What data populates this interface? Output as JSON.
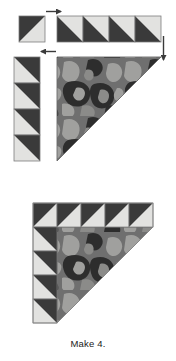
{
  "page": {
    "background_color": "#ffffff",
    "width": 176,
    "height": 361
  },
  "caption": {
    "text": "Make 4.",
    "color": "#1a1a1a"
  },
  "palette": {
    "dark": "#3a3a3a",
    "dark_edge": "#2b2b2b",
    "light": "#e2e2e0",
    "light_edge": "#cfcfcd",
    "print_base": "#6f6f6f",
    "print_shadow": "#2d2d2d",
    "print_highlight": "#a0a09e",
    "outline": "#7a7a7a",
    "arrow": "#3a3a3a",
    "text": "#1a1a1a"
  },
  "steps": [
    {
      "id": "step-1",
      "name": "top-unit-row",
      "description": "A single half-square triangle unit joined to a strip of four half-square triangle units.",
      "pieces": [
        {
          "name": "single-hst-unit",
          "kind": "half-square-triangle",
          "count": 1,
          "orientation": "dark-upper-left",
          "x": 19,
          "y": 16,
          "size": 26
        },
        {
          "name": "hst-strip-horizontal",
          "kind": "half-square-triangle-strip",
          "count": 4,
          "orientation": "dark-lower-left",
          "x": 57,
          "y": 16,
          "size": 26,
          "direction": "horizontal"
        }
      ],
      "arrows": [
        {
          "name": "arrow-right-top",
          "direction": "right",
          "x": 46,
          "y": 11,
          "length": 18
        },
        {
          "name": "arrow-down-right",
          "direction": "down",
          "x": 163,
          "y": 34,
          "length": 28
        }
      ]
    },
    {
      "id": "step-2",
      "name": "column-and-print-triangle",
      "description": "A vertical strip of four half-square triangle units placed beside the large printed corner triangle.",
      "pieces": [
        {
          "name": "hst-strip-vertical",
          "kind": "half-square-triangle-strip",
          "count": 4,
          "orientation": "dark-upper-right",
          "x": 14,
          "y": 57,
          "size": 26,
          "direction": "vertical"
        },
        {
          "name": "large-print-triangle",
          "kind": "printed-half-square-triangle",
          "count": 1,
          "orientation": "print-upper-left",
          "x": 57,
          "y": 57,
          "size": 104
        }
      ],
      "arrows": [
        {
          "name": "arrow-left-mid",
          "direction": "left",
          "x": 38,
          "y": 51,
          "length": 18
        }
      ]
    },
    {
      "id": "step-3",
      "name": "finished-corner-unit",
      "description": "Completed corner unit: printed triangle framed by a row of five and a column of four half-square triangle units.",
      "pieces": [
        {
          "name": "finished-top-row",
          "kind": "half-square-triangle-strip",
          "count": 5,
          "orientation": "dark-upper-left",
          "x": 33,
          "y": 203,
          "size": 24,
          "direction": "horizontal"
        },
        {
          "name": "finished-left-column",
          "kind": "half-square-triangle-strip",
          "count": 4,
          "orientation": "dark-upper-right",
          "x": 33,
          "y": 227,
          "size": 24,
          "direction": "vertical"
        },
        {
          "name": "finished-print-triangle",
          "kind": "printed-half-square-triangle",
          "count": 1,
          "orientation": "print-upper-left",
          "x": 57,
          "y": 227,
          "size": 96
        }
      ],
      "arrows": []
    }
  ]
}
